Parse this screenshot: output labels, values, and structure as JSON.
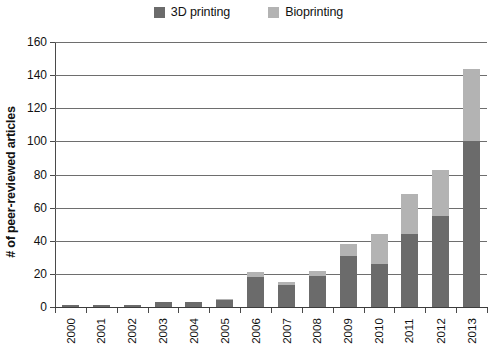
{
  "legend": {
    "position": "top-center",
    "entries": [
      {
        "label": "3D printing",
        "color": "#6b6b6b",
        "swatch_name": "legend-swatch-3d-printing"
      },
      {
        "label": "Bioprinting",
        "color": "#b3b3b3",
        "swatch_name": "legend-swatch-bioprinting"
      }
    ]
  },
  "chart_data": {
    "type": "bar",
    "subtype": "stacked-vertical",
    "title": "",
    "xlabel": "",
    "ylabel": "# of peer-reviewed articles",
    "categories": [
      "2000",
      "2001",
      "2002",
      "2003",
      "2004",
      "2005",
      "2006",
      "2007",
      "2008",
      "2009",
      "2010",
      "2011",
      "2012",
      "2013"
    ],
    "series": [
      {
        "name": "3D printing",
        "color": "#6b6b6b",
        "values": [
          1,
          1,
          1,
          3,
          3,
          4,
          18,
          13,
          19,
          31,
          26,
          44,
          55,
          100
        ]
      },
      {
        "name": "Bioprinting",
        "color": "#b3b3b3",
        "values": [
          0,
          0,
          0,
          0,
          0,
          1,
          3,
          2,
          3,
          7,
          18,
          24,
          28,
          44
        ]
      }
    ],
    "totals": [
      1,
      1,
      1,
      3,
      3,
      5,
      21,
      15,
      22,
      38,
      44,
      68,
      83,
      144
    ],
    "ylim": [
      0,
      160
    ],
    "yticks": [
      0,
      20,
      40,
      60,
      80,
      100,
      120,
      140,
      160
    ],
    "ytick_labels": [
      "0",
      "20",
      "40",
      "60",
      "80",
      "100",
      "120",
      "140",
      "160"
    ],
    "grid": true,
    "grid_axis": "y",
    "legend_position": "top-center"
  }
}
